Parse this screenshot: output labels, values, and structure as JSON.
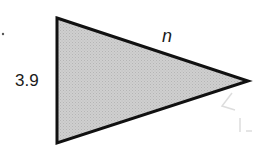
{
  "diagram": {
    "shape": "triangle",
    "fill_color": "#c8c8c8",
    "stroke_color": "#111111",
    "vertices": {
      "top_left": [
        57,
        18
      ],
      "bottom_left": [
        57,
        143
      ],
      "right": [
        248,
        81
      ]
    },
    "labels": {
      "left_side": "3.9",
      "upper_side": "n"
    }
  }
}
